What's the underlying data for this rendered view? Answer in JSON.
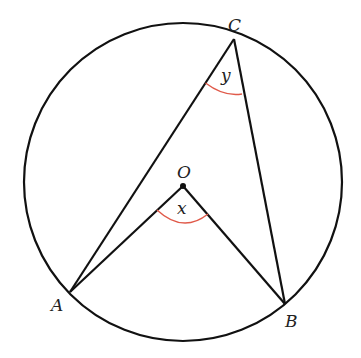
{
  "diagram": {
    "type": "circle-theorem",
    "colors": {
      "stroke": "#111111",
      "angle_arc": "#e05a4a",
      "label": "#222222"
    },
    "circle": {
      "center": [
        183,
        182
      ],
      "radius": 159
    },
    "points": {
      "A": {
        "label": "A",
        "pos": [
          70,
          292
        ],
        "label_pos": [
          50,
          311
        ]
      },
      "B": {
        "label": "B",
        "pos": [
          285,
          304
        ],
        "label_pos": [
          285,
          326
        ]
      },
      "C": {
        "label": "C",
        "pos": [
          234,
          39
        ],
        "label_pos": [
          228,
          31
        ]
      },
      "O": {
        "label": "O",
        "pos": [
          183,
          186
        ],
        "label_pos": [
          177,
          177
        ]
      }
    },
    "angles": {
      "x": {
        "label": "x",
        "vertex": "O",
        "label_pos": [
          177,
          213
        ]
      },
      "y": {
        "label": "y",
        "vertex": "C",
        "label_pos": [
          221,
          80
        ]
      }
    },
    "segments": [
      [
        "C",
        "A"
      ],
      [
        "C",
        "B"
      ],
      [
        "O",
        "A"
      ],
      [
        "O",
        "B"
      ]
    ]
  }
}
